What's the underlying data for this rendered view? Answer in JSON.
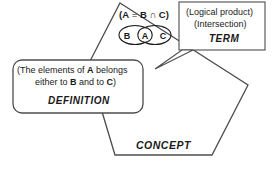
{
  "diagram": {
    "background_color": "#ffffff",
    "line_color": "#4d4d4d",
    "text_color": "#1a1a1a"
  },
  "concept": {
    "label": "CONCEPT"
  },
  "term_box": {
    "line1": "(Logical product)",
    "line2": "(Intersection)",
    "label": "TERM"
  },
  "definition_box": {
    "line1_prefix": "(The elements of ",
    "line1_bold": "A",
    "line1_suffix": " belongs",
    "line2_prefix": "either to ",
    "line2_bold1": "B",
    "line2_middle": " and to ",
    "line2_bold2": "C",
    "line2_suffix": ")",
    "label": "DEFINITION"
  },
  "formula": {
    "open_paren": "(",
    "a": "A",
    "equals": " = ",
    "b": "B",
    "operator": " ∩ ",
    "c": "C",
    "close_paren": ")",
    "full": "(A = B ∩ C)"
  },
  "venn": {
    "set_b": "B",
    "set_a": "A",
    "set_c": "C"
  }
}
